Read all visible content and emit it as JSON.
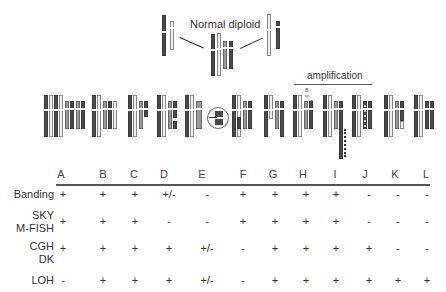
{
  "diagram": {
    "title": "Normal diploid",
    "amplification_label": "amplification"
  },
  "table": {
    "columns": [
      "A",
      "B",
      "C",
      "D",
      "E",
      "F",
      "G",
      "H",
      "I",
      "J",
      "K",
      "L"
    ],
    "rows": [
      {
        "label_line1": "Banding",
        "label_line2": "",
        "values": [
          "+",
          "+",
          "+",
          "+/-",
          "-",
          "+",
          "+",
          "+",
          "+",
          "-",
          "-",
          "-"
        ]
      },
      {
        "label_line1": "SKY",
        "label_line2": "M-FISH",
        "values": [
          "+",
          "+",
          "+",
          "-",
          "-",
          "+",
          "+",
          "+",
          "+",
          "-",
          "-",
          "-"
        ]
      },
      {
        "label_line1": "CGH",
        "label_line2": "DK",
        "values": [
          "+",
          "+",
          "+",
          "+",
          "+/-",
          "-",
          "+",
          "+",
          "+",
          "+",
          "-",
          "-"
        ]
      },
      {
        "label_line1": "LOH",
        "label_line2": "",
        "values": [
          "-",
          "+",
          "+",
          "+",
          "+/-",
          "-",
          "+",
          "+",
          "+",
          "+",
          "+",
          "+"
        ]
      }
    ]
  },
  "colors": {
    "dark_chromosome": "#4a4a4a",
    "light_chromosome": "#f0f0f0",
    "mid_chromosome": "#9a9a9a",
    "rule": "#555555"
  }
}
